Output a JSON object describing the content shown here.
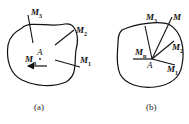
{
  "panel_a": {
    "caption": "(a)",
    "point": "A",
    "labels": {
      "m3": "M",
      "m3_sub": "3",
      "m2": "M",
      "m2_sub": "2",
      "m1": "M",
      "m1_sub": "1",
      "mn": "M",
      "mn_sub": "n"
    }
  },
  "panel_b": {
    "caption": "(b)",
    "point": "A",
    "labels": {
      "m": "M",
      "m3": "M",
      "m3_sub": "3",
      "m2": "M",
      "m2_sub": "2",
      "m1": "M",
      "m1_sub": "1",
      "mn": "M",
      "mn_sub": "n"
    }
  }
}
